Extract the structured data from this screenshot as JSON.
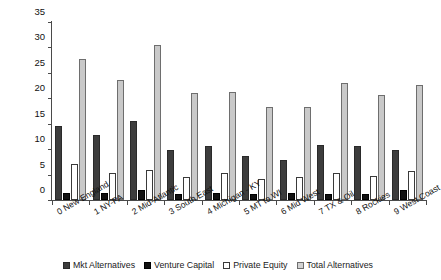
{
  "chart_data": {
    "type": "bar",
    "title": "",
    "xlabel": "",
    "ylabel": "Percentage of Total Assets",
    "ylim": [
      0,
      35
    ],
    "yticks": [
      0,
      5,
      10,
      15,
      20,
      25,
      30,
      35
    ],
    "grid": false,
    "legend_position": "bottom",
    "categories": [
      "0 New England",
      "1 NY-PA",
      "2 Mid-Atlantic",
      "3 South East",
      "4 Michigan - KY",
      "5 MT to WI",
      "6 Mid West",
      "7 TX & Oil",
      "8 Rockies",
      "9 West Coast"
    ],
    "series": [
      {
        "name": "Mkt Alternatives",
        "color": "#3d3d3d",
        "values": [
          14.5,
          12.8,
          15.5,
          9.8,
          10.6,
          8.6,
          7.8,
          10.8,
          10.6,
          9.9
        ]
      },
      {
        "name": "Venture Capital",
        "color": "#111111",
        "values": [
          1.4,
          1.3,
          2.0,
          1.2,
          1.4,
          1.2,
          1.4,
          1.2,
          1.2,
          2.0
        ]
      },
      {
        "name": "Private Equity",
        "color": "#ffffff",
        "values": [
          7.0,
          5.4,
          6.0,
          4.6,
          5.4,
          4.2,
          4.6,
          5.4,
          4.8,
          5.8
        ]
      },
      {
        "name": "Total Alternatives",
        "color": "#c9c9c9",
        "values": [
          27.8,
          23.6,
          30.4,
          21.0,
          21.3,
          18.2,
          18.3,
          23.0,
          20.6,
          22.6
        ]
      }
    ]
  }
}
